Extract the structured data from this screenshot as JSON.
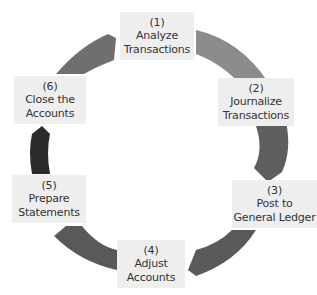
{
  "diagram": {
    "type": "cycle",
    "steps": [
      {
        "num": "(1)",
        "line1": "Analyze",
        "line2": "Transactions"
      },
      {
        "num": "(2)",
        "line1": "Journalize",
        "line2": "Transactions"
      },
      {
        "num": "(3)",
        "line1": "Post to",
        "line2": "General Ledger"
      },
      {
        "num": "(4)",
        "line1": "Adjust",
        "line2": "Accounts"
      },
      {
        "num": "(5)",
        "line1": "Prepare",
        "line2": "Statements"
      },
      {
        "num": "(6)",
        "line1": "Close the",
        "line2": "Accounts"
      }
    ],
    "arc_colors": [
      "#8a8a8a",
      "#5f5f5f",
      "#555555",
      "#5a5a5a",
      "#2a2a2a",
      "#6e6e6e"
    ]
  }
}
